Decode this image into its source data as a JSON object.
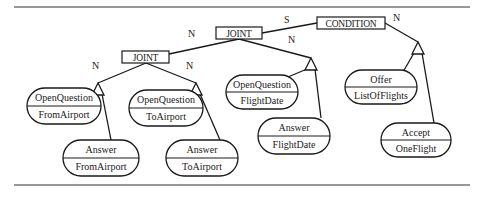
{
  "diagram": {
    "type": "tree",
    "rules": {
      "top_y": 7,
      "bottom_y": 185,
      "x1": 14,
      "x2": 470
    },
    "relation_nodes": [
      {
        "id": "condition",
        "label": "CONDITION",
        "x": 317,
        "y": 17,
        "w": 68,
        "h": 12
      },
      {
        "id": "joint_top",
        "label": "JOINT",
        "x": 216,
        "y": 27,
        "w": 46,
        "h": 12
      },
      {
        "id": "joint_left",
        "label": "JOINT",
        "x": 122,
        "y": 51,
        "w": 47,
        "h": 12
      }
    ],
    "edge_labels": [
      {
        "text": "S",
        "x": 284,
        "y": 23
      },
      {
        "text": "N",
        "x": 393,
        "y": 21
      },
      {
        "text": "N",
        "x": 188,
        "y": 37
      },
      {
        "text": "N",
        "x": 288,
        "y": 43
      },
      {
        "text": "N",
        "x": 92,
        "y": 69
      },
      {
        "text": "N",
        "x": 186,
        "y": 69
      }
    ],
    "triangles": [
      {
        "id": "tri_condition_n",
        "x": 418,
        "y": 42
      },
      {
        "id": "tri_joint_top_n",
        "x": 311,
        "y": 58
      },
      {
        "id": "tri_joint_left_n1",
        "x": 98,
        "y": 83
      },
      {
        "id": "tri_joint_left_n2",
        "x": 196,
        "y": 83
      }
    ],
    "act_nodes": [
      {
        "id": "oq_from",
        "top": "OpenQuestion",
        "bottom": "FromAirport",
        "cx": 64,
        "cy": 106,
        "w": 74,
        "h": 36
      },
      {
        "id": "ans_from",
        "top": "Answer",
        "bottom": "FromAirport",
        "cx": 101,
        "cy": 158,
        "w": 76,
        "h": 36
      },
      {
        "id": "oq_to",
        "top": "OpenQuestion",
        "bottom": "ToAirport",
        "cx": 166,
        "cy": 108,
        "w": 74,
        "h": 36
      },
      {
        "id": "ans_to",
        "top": "Answer",
        "bottom": "ToAirport",
        "cx": 202,
        "cy": 158,
        "w": 72,
        "h": 36
      },
      {
        "id": "oq_date",
        "top": "OpenQuestion",
        "bottom": "FlightDate",
        "cx": 262,
        "cy": 92,
        "w": 72,
        "h": 34
      },
      {
        "id": "ans_date",
        "top": "Answer",
        "bottom": "FlightDate",
        "cx": 294,
        "cy": 136,
        "w": 72,
        "h": 36
      },
      {
        "id": "offer",
        "top": "Offer",
        "bottom": "ListOfFlights",
        "cx": 381,
        "cy": 87,
        "w": 72,
        "h": 34
      },
      {
        "id": "accept",
        "top": "Accept",
        "bottom": "OneFlight",
        "cx": 416,
        "cy": 140,
        "w": 70,
        "h": 34
      }
    ]
  }
}
